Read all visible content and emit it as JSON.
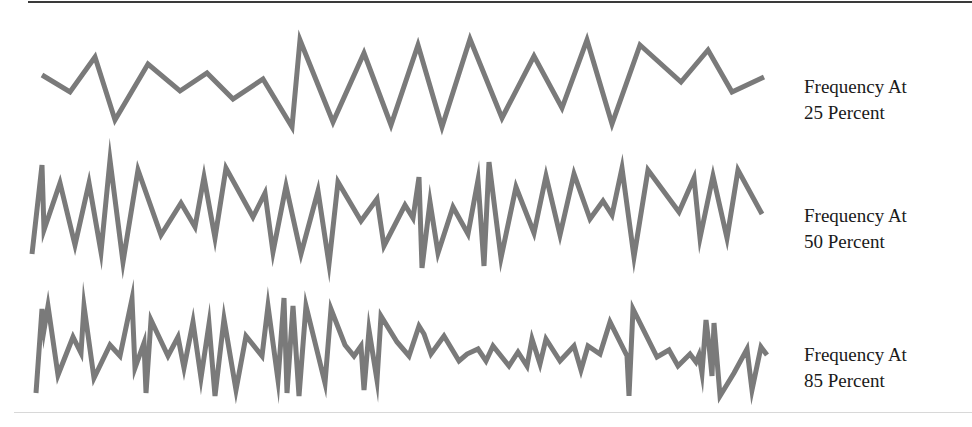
{
  "figure": {
    "stroke_color": "#7a7a7a",
    "rule_color": "#3a3a3a",
    "rows": [
      {
        "id": "freq-25",
        "label_line1": "Frequency At",
        "label_line2": "25 Percent",
        "label_top": 74,
        "points": "42,75 70,92 95,57 115,120 148,64 180,91 207,73 233,99 263,79 292,127 300,40 333,122 364,53 391,125 418,45 442,127 470,39 502,118 534,56 562,108 587,40 612,124 640,45 681,82 708,50 732,92 764,77"
      },
      {
        "id": "freq-50",
        "label_line1": "Frequency At",
        "label_line2": "50 Percent",
        "label_top": 203,
        "points": "32,254 42,165 44,230 60,183 75,245 89,183 101,252 110,160 123,262 138,170 161,235 181,203 195,227 204,177 215,238 226,168 253,217 265,193 273,252 286,186 301,254 318,191 329,264 338,182 361,221 377,199 384,246 405,205 413,218 419,177 422,268 430,202 438,253 453,207 468,234 478,180 484,266 489,162 501,258 516,187 534,233 546,176 560,235 574,174 590,219 603,201 612,215 622,168 634,257 648,170 679,212 694,178 700,238 713,176 727,238 738,170 762,214"
      },
      {
        "id": "freq-85",
        "label_line1": "Frequency At",
        "label_line2": "85 Percent",
        "label_top": 342,
        "points": "36,393 42,309 44,330 48,306 58,375 73,337 81,353 84,306 94,378 110,345 120,356 132,299 135,368 144,343 146,393 151,320 168,356 178,337 184,368 193,322 201,378 209,324 215,396 224,319 236,390 246,336 262,356 268,306 278,380 284,298 287,393 293,306 299,396 306,306 325,383 331,309 345,345 354,356 361,346 364,390 369,330 377,380 381,316 397,342 409,356 419,326 424,334 431,354 444,336 459,361 467,354 478,349 486,361 493,346 509,366 518,352 527,366 532,339 540,364 546,339 560,361 574,346 581,370 588,346 600,354 610,322 627,356 629,396 633,309 657,357 669,350 678,366 690,354 696,362 699,355 702,373 706,320 709,345 712,376 714,323 720,396 734,373 747,349 752,390 761,347 767,355"
      }
    ]
  }
}
